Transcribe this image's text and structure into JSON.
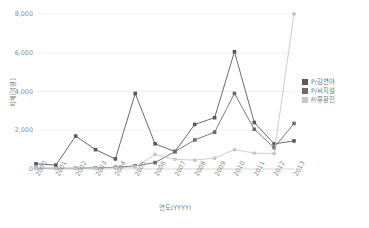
{
  "chart_data": {
    "type": "line",
    "title": "",
    "xlabel": "연도(YYYY)",
    "ylabel": "피해[억원]",
    "categories": [
      "2000",
      "2001",
      "2002",
      "2003",
      "2004",
      "2005",
      "2006",
      "2007",
      "2008",
      "2009",
      "2010",
      "2011",
      "2012",
      "2013"
    ],
    "ylim": [
      0,
      8000
    ],
    "yticks": [
      0,
      2000,
      4000,
      6000,
      8000
    ],
    "ytick_labels": [
      "0",
      "2,000",
      "4,000",
      "6,000",
      "8,000"
    ],
    "grid": true,
    "legend_position": "right",
    "series": [
      {
        "name": "P/김연아",
        "color": "#595959",
        "marker": "square",
        "values": [
          270,
          200,
          1700,
          1000,
          520,
          3900,
          1300,
          900,
          2300,
          2650,
          6050,
          2400,
          1300,
          1450
        ]
      },
      {
        "name": "P/씨지섬",
        "color": "#6b6b6b",
        "marker": "square",
        "values": [
          40,
          40,
          40,
          60,
          90,
          160,
          330,
          900,
          1500,
          1900,
          3900,
          2050,
          1100,
          2350
        ]
      },
      {
        "name": "P/휴환진",
        "color": "#c7c7c7",
        "marker": "circle",
        "values": [
          30,
          30,
          30,
          40,
          60,
          110,
          750,
          500,
          460,
          560,
          1000,
          820,
          800,
          8000
        ]
      }
    ]
  },
  "axis": {
    "y_title": "피해[억원]",
    "x_title": "연도(YYYY)"
  },
  "legend": {
    "items": [
      {
        "label": "P/김연아",
        "color": "#595959"
      },
      {
        "label": "P/씨지섬",
        "color": "#6b6b6b"
      },
      {
        "label": "P/휴환진",
        "color": "#c7c7c7"
      }
    ]
  }
}
